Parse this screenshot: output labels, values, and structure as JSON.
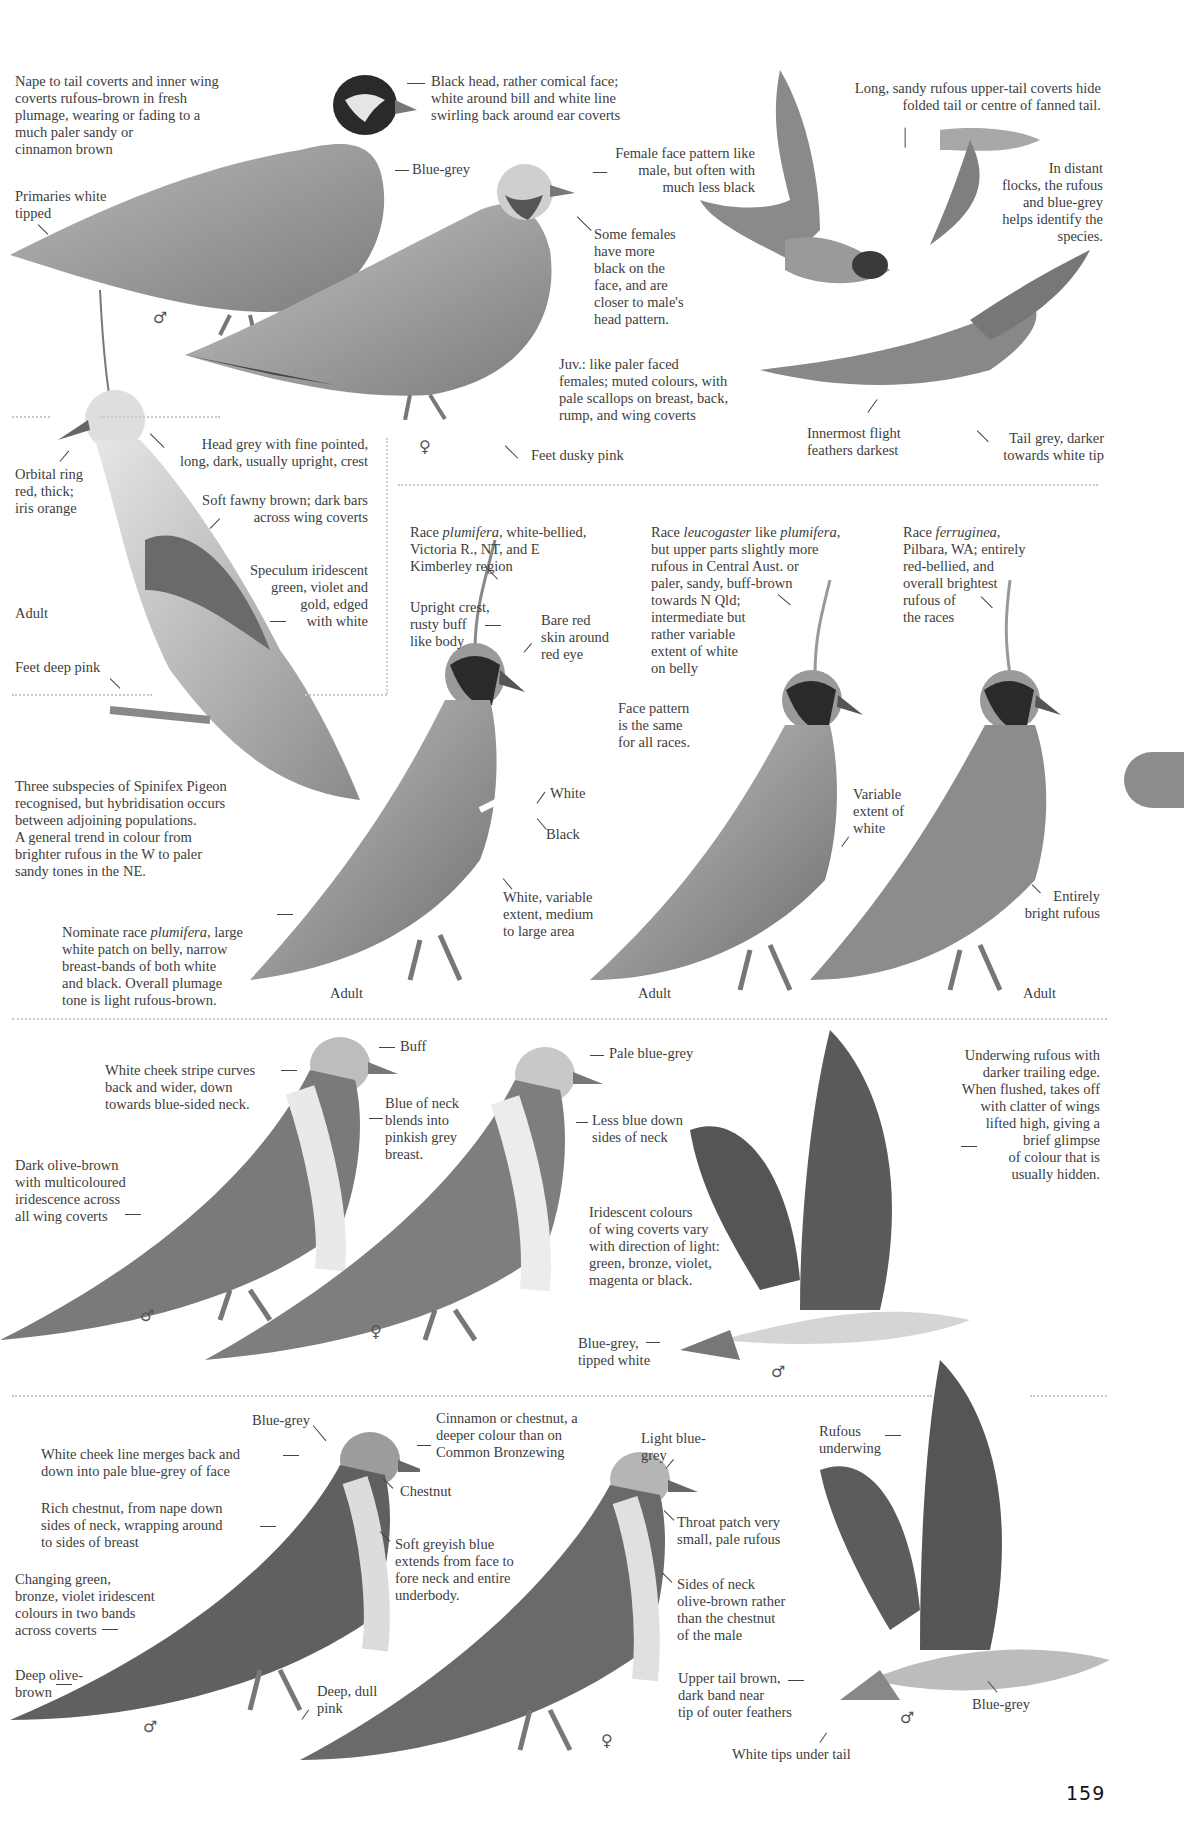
{
  "page": {
    "number": "159",
    "thumb_tab_color": "#8c8c8c"
  },
  "section1": {
    "species": "Flock Bronzewing",
    "labels": {
      "nape": "Nape to tail coverts and inner wing\ncoverts rufous-brown in fresh\nplumage, wearing or fading to a\nmuch paler sandy or\ncinnamon brown",
      "primaries": "Primaries white\ntipped",
      "black_head": "Black head, rather comical face;\nwhite around bill and white line\nswirling back around ear coverts",
      "blue_grey": "Blue-grey",
      "female_face": "Female face pattern like\nmale, but often with\nmuch less black",
      "some_females": "Some females\nhave more\nblack on the\nface, and are\ncloser to male's\nhead pattern.",
      "juv": "Juv.:  like paler faced\nfemales; muted colours, with\npale scallops on breast, back,\nrump, and wing coverts",
      "feet": "Feet dusky pink",
      "uppertail": "Long, sandy rufous upper-tail coverts hide\nfolded tail or centre of fanned tail.",
      "distant_flocks": "In distant\nflocks, the rufous\nand blue-grey\nhelps identify the\nspecies.",
      "innermost": "Innermost flight\nfeathers darkest",
      "tail_grey": "Tail grey, darker\ntowards white tip",
      "male_symbol": "♂",
      "female_symbol": "♀"
    }
  },
  "section2": {
    "species": "Crested Pigeon",
    "labels": {
      "head_grey": "Head grey with fine pointed,\nlong, dark, usually upright, crest",
      "orbital": "Orbital ring\nred, thick;\niris orange",
      "fawny": "Soft fawny brown; dark bars\nacross wing coverts",
      "speculum": "Speculum iridescent\ngreen, violet and\ngold, edged\nwith white",
      "adult": "Adult",
      "feet": "Feet deep pink"
    }
  },
  "section3": {
    "species": "Spinifex Pigeon",
    "labels": {
      "intro": "Three subspecies of Spinifex Pigeon\nrecognised, but hybridisation occurs\nbetween adjoining populations.\nA general trend in colour from\nbrighter rufous in the W to paler\nsandy tones in the NE.",
      "nominate_pre": "Nominate race ",
      "nominate_race": "plumifera,",
      "nominate_post": " large\nwhite patch on belly, narrow\nbreast-bands of both white\nand black. Overall plumage\ntone is light rufous-brown.",
      "race1_pre": "Race ",
      "race1_name": "plumifera,",
      "race1_post": " white-bellied,\nVictoria R., NT, and E\nKimberley region",
      "upright_crest": "Upright crest,\nrusty buff\nlike body",
      "bare_red": "Bare red\nskin around\nred eye",
      "white": "White",
      "black": "Black",
      "white_variable": "White, variable\nextent, medium\nto large area",
      "race2_pre": "Race ",
      "race2_name": "leucogaster",
      "race2_mid": " like ",
      "race2_name2": "plumifera,",
      "race2_post": "\nbut upper parts slightly more\nrufous in Central Aust. or\npaler, sandy, buff-brown\ntowards N Qld;\nintermediate but\nrather variable\nextent of white\non belly",
      "face_pattern": "Face pattern\nis the same\nfor all races.",
      "variable_white": "Variable\nextent of\nwhite",
      "race3_pre": "Race ",
      "race3_name": "ferruginea,",
      "race3_post": "\nPilbara, WA; entirely\nred-bellied, and\noverall brightest\nrufous of\nthe races",
      "entirely_rufous": "Entirely\nbright rufous",
      "adult_1": "Adult",
      "adult_2": "Adult",
      "adult_3": "Adult"
    }
  },
  "section4": {
    "species": "Common Bronzewing",
    "labels": {
      "buff": "Buff",
      "cheek_stripe": "White cheek stripe curves\nback and wider, down\ntowards blue-sided neck.",
      "blue_neck": "Blue of neck\nblends into\npinkish grey\nbreast.",
      "dark_olive": "Dark olive-brown\nwith multicoloured\niridescence across\nall wing coverts",
      "pale_blue_grey": "Pale blue-grey",
      "less_blue": "Less blue down\nsides of neck",
      "iridescent": "Iridescent colours\nof wing coverts vary\nwith direction of light:\ngreen, bronze, violet,\nmagenta or black.",
      "tail_blue_grey": "Blue-grey,\ntipped white",
      "underwing": "Underwing rufous with\ndarker trailing edge.\nWhen flushed, takes off\nwith clatter of wings\nlifted high, giving a\nbrief glimpse\nof colour that is\nusually hidden.",
      "male_symbol": "♂",
      "female_symbol": "♀",
      "flight_male_symbol": "♂"
    }
  },
  "section5": {
    "species": "Brush Bronzewing",
    "labels": {
      "blue_grey_crown": "Blue-grey",
      "cinnamon": "Cinnamon or chestnut, a\ndeeper colour than on\nCommon Bronzewing",
      "cheek_line": "White cheek line merges back and\ndown into pale blue-grey of face",
      "chestnut": "Chestnut",
      "rich_chestnut": "Rich chestnut, from nape down\nsides of neck, wrapping around\nto sides of breast",
      "soft_greyish": "Soft greyish blue\nextends from face to\nfore neck and entire\nunderbody.",
      "changing_green": "Changing green,\nbronze, violet iridescent\ncolours in two bands\nacross coverts",
      "deep_olive": "Deep olive-\nbrown",
      "deep_dull_pink": "Deep, dull\npink",
      "light_blue_grey": "Light blue-\ngrey",
      "throat_patch": "Throat patch very\nsmall, pale rufous",
      "sides_neck": "Sides of neck\nolive-brown rather\nthan the chestnut\nof the male",
      "upper_tail": "Upper tail brown,\ndark band near\ntip of outer feathers",
      "white_tips": "White tips under tail",
      "rufous_underwing": "Rufous\nunderwing",
      "flight_blue_grey": "Blue-grey",
      "male_symbol": "♂",
      "female_symbol": "♀",
      "flight_male_symbol": "♂"
    }
  }
}
